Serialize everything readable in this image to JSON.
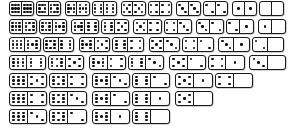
{
  "diagram": {
    "set_type": "double-nine",
    "max_pips": 9,
    "tile_count": 55,
    "layout": "staircase",
    "colors": {
      "tile_fill": "#ffffff",
      "tile_border": "#1a1a1a",
      "pip": "#111111",
      "background": "#ffffff"
    },
    "pip_patterns": {
      "0": [
        0,
        0,
        0,
        0,
        0,
        0,
        0,
        0,
        0
      ],
      "1": [
        0,
        0,
        0,
        0,
        1,
        0,
        0,
        0,
        0
      ],
      "2": [
        1,
        0,
        0,
        0,
        0,
        0,
        0,
        0,
        1
      ],
      "3": [
        1,
        0,
        0,
        0,
        1,
        0,
        0,
        0,
        1
      ],
      "4": [
        1,
        0,
        1,
        0,
        0,
        0,
        1,
        0,
        1
      ],
      "5": [
        1,
        0,
        1,
        0,
        1,
        0,
        1,
        0,
        1
      ],
      "6": [
        1,
        0,
        1,
        1,
        0,
        1,
        1,
        0,
        1
      ],
      "7": [
        1,
        0,
        1,
        1,
        1,
        1,
        1,
        0,
        1
      ],
      "8": [
        1,
        1,
        1,
        1,
        0,
        1,
        1,
        1,
        1
      ],
      "9": [
        1,
        1,
        1,
        1,
        1,
        1,
        1,
        1,
        1
      ]
    },
    "rows": [
      {
        "label": "row-1",
        "tiles": [
          [
            9,
            9
          ],
          [
            8,
            8
          ],
          [
            7,
            7
          ],
          [
            6,
            6
          ],
          [
            5,
            5
          ],
          [
            4,
            4
          ],
          [
            3,
            3
          ],
          [
            2,
            2
          ],
          [
            1,
            1
          ],
          [
            0,
            0
          ]
        ]
      },
      {
        "label": "row-2",
        "tiles": [
          [
            9,
            8
          ],
          [
            8,
            7
          ],
          [
            7,
            6
          ],
          [
            6,
            5
          ],
          [
            5,
            4
          ],
          [
            4,
            3
          ],
          [
            3,
            2
          ],
          [
            2,
            1
          ],
          [
            1,
            0
          ]
        ]
      },
      {
        "label": "row-3",
        "tiles": [
          [
            9,
            7
          ],
          [
            8,
            6
          ],
          [
            7,
            5
          ],
          [
            6,
            4
          ],
          [
            5,
            3
          ],
          [
            4,
            2
          ],
          [
            3,
            1
          ],
          [
            2,
            0
          ]
        ]
      },
      {
        "label": "row-4",
        "tiles": [
          [
            9,
            6
          ],
          [
            8,
            5
          ],
          [
            7,
            4
          ],
          [
            6,
            3
          ],
          [
            5,
            2
          ],
          [
            4,
            1
          ],
          [
            3,
            0
          ]
        ]
      },
      {
        "label": "row-5",
        "tiles": [
          [
            9,
            5
          ],
          [
            8,
            4
          ],
          [
            7,
            3
          ],
          [
            6,
            2
          ],
          [
            5,
            1
          ],
          [
            4,
            0
          ]
        ]
      },
      {
        "label": "row-6",
        "tiles": [
          [
            9,
            4
          ],
          [
            8,
            3
          ],
          [
            7,
            2
          ],
          [
            6,
            1
          ],
          [
            5,
            0
          ]
        ]
      },
      {
        "label": "row-7",
        "tiles": [
          [
            9,
            3
          ],
          [
            8,
            2
          ],
          [
            7,
            1
          ],
          [
            6,
            0
          ]
        ]
      },
      {
        "label": "row-8",
        "tiles": [
          [
            9,
            2
          ],
          [
            8,
            1
          ],
          [
            7,
            0
          ]
        ]
      },
      {
        "label": "row-9",
        "tiles": [
          [
            9,
            1
          ],
          [
            8,
            0
          ]
        ]
      },
      {
        "label": "row-10",
        "tiles": [
          [
            9,
            0
          ]
        ]
      }
    ]
  }
}
